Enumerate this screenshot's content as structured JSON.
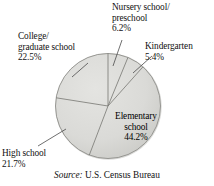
{
  "chart_data": {
    "type": "pie",
    "title": "",
    "subtitle": "",
    "xlabel": "",
    "ylabel": "",
    "legend_position": "none",
    "grid": false,
    "units": "percent",
    "start_angle_deg": 0,
    "direction": "clockwise",
    "categories": [
      "Nursery school/preschool",
      "Kindergarten",
      "Elementary school",
      "High school",
      "College/graduate school"
    ],
    "values": [
      6.2,
      5.4,
      44.2,
      21.7,
      22.5
    ],
    "slices": [
      {
        "name": "Nursery school/preschool",
        "label_line1": "Nursery school/",
        "label_line2": "preschool",
        "value_label": "6.2%",
        "value": 6.2,
        "placement": "outside",
        "leader": true
      },
      {
        "name": "Kindergarten",
        "label_line1": "Kindergarten",
        "label_line2": "",
        "value_label": "5.4%",
        "value": 5.4,
        "placement": "outside",
        "leader": true
      },
      {
        "name": "Elementary school",
        "label_line1": "Elementary",
        "label_line2": "school",
        "value_label": "44.2%",
        "value": 44.2,
        "placement": "inside",
        "leader": false
      },
      {
        "name": "High school",
        "label_line1": "High school",
        "label_line2": "",
        "value_label": "21.7%",
        "value": 21.7,
        "placement": "outside",
        "leader": true
      },
      {
        "name": "College/graduate school",
        "label_line1": "College/",
        "label_line2": "graduate school",
        "value_label": "22.5%",
        "value": 22.5,
        "placement": "outside",
        "leader": true
      }
    ],
    "colors": {
      "slice_fill": "#d9d9d6",
      "slice_edge": "#8c8c8c",
      "shadow_edge": "#a8a8a4",
      "text": "#111111",
      "background": "#ffffff"
    }
  },
  "source": {
    "prefix": "Source:",
    "text": "U.S. Census Bureau"
  }
}
